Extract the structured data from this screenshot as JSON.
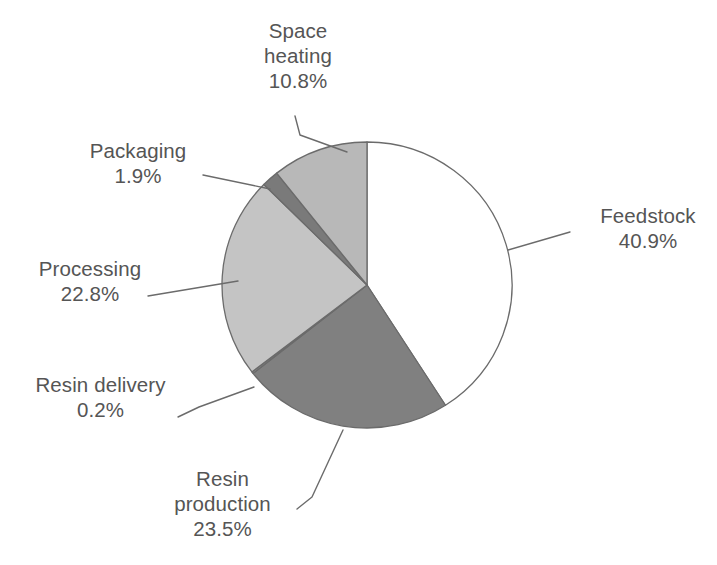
{
  "chart_data": {
    "type": "pie",
    "title": "",
    "subtitle": "",
    "xlabel": "",
    "ylabel": "",
    "legend_position": "none",
    "grid": false,
    "units": "percent",
    "start_angle_deg": 0,
    "direction": "clockwise",
    "categories": [
      "Feedstock",
      "Resin production",
      "Resin delivery",
      "Processing",
      "Packaging",
      "Space heating"
    ],
    "values": [
      40.9,
      23.5,
      0.2,
      22.8,
      1.9,
      10.8
    ],
    "slices": [
      {
        "label": "Feedstock",
        "percent_text": "40.9%",
        "value": 40.9,
        "color": "#ffffff",
        "stroke": "#6b6b6b",
        "start_deg": 0.0,
        "end_deg": 147.24
      },
      {
        "label": "Resin production",
        "percent_text": "23.5%",
        "value": 23.5,
        "color": "#808080",
        "stroke": "#6b6b6b",
        "start_deg": 147.24,
        "end_deg": 231.84
      },
      {
        "label": "Resin delivery",
        "percent_text": "0.2%",
        "value": 0.2,
        "color": "#9a9a9a",
        "stroke": "#6b6b6b",
        "start_deg": 231.84,
        "end_deg": 232.56
      },
      {
        "label": "Processing",
        "percent_text": "22.8%",
        "value": 22.8,
        "color": "#c4c4c4",
        "stroke": "#6b6b6b",
        "start_deg": 232.56,
        "end_deg": 314.64
      },
      {
        "label": "Packaging",
        "percent_text": "1.9%",
        "value": 1.9,
        "color": "#7a7a7a",
        "stroke": "#6b6b6b",
        "start_deg": 314.64,
        "end_deg": 321.48
      },
      {
        "label": "Space heating",
        "percent_text": "10.8%",
        "value": 10.8,
        "color": "#b8b8b8",
        "stroke": "#6b6b6b",
        "start_deg": 321.48,
        "end_deg": 360.0
      }
    ]
  },
  "labels": {
    "space_heating": {
      "name_line1": "Space",
      "name_line2": "heating",
      "percent": "10.8%"
    },
    "packaging": {
      "name": "Packaging",
      "percent": "1.9%"
    },
    "processing": {
      "name": "Processing",
      "percent": "22.8%"
    },
    "resin_delivery": {
      "name": "Resin delivery",
      "percent": "0.2%"
    },
    "resin_production": {
      "name_line1": "Resin",
      "name_line2": "production",
      "percent": "23.5%"
    },
    "feedstock": {
      "name": "Feedstock",
      "percent": "40.9%"
    }
  },
  "colors": {
    "outline": "#6b6b6b",
    "leader_line": "#6b6b6b",
    "text": "#555555",
    "background": "#ffffff"
  }
}
